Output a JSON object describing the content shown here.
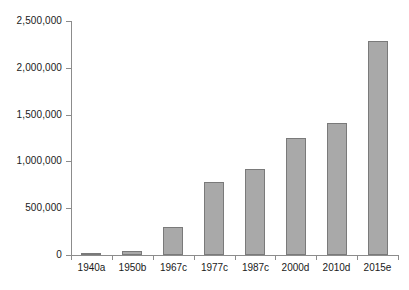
{
  "chart_data": {
    "type": "bar",
    "title": "",
    "subtitle": "",
    "xlabel": "",
    "ylabel": "",
    "categories": [
      "1940a",
      "1950b",
      "1967c",
      "1977c",
      "1987c",
      "2000d",
      "2010d",
      "2015e"
    ],
    "values": [
      20000,
      45000,
      295000,
      780000,
      920000,
      1250000,
      1410000,
      2290000
    ],
    "series": [
      {
        "name": "",
        "values": [
          20000,
          45000,
          295000,
          780000,
          920000,
          1250000,
          1410000,
          2290000
        ]
      }
    ],
    "ylim": [
      0,
      2500000
    ],
    "ytick_values": [
      0,
      500000,
      1000000,
      1500000,
      2000000,
      2500000
    ],
    "ytick_labels": [
      "0",
      "500,000",
      "1,000,000",
      "1,500,000",
      "2,000,000",
      "2,500,000"
    ],
    "grid": false,
    "legend": false,
    "legend_position": "none",
    "bar_color": "#a9a9a9",
    "bar_border_color": "#7a7a7a",
    "axis_color": "#8c8c8c",
    "text_color": "#1a1a1a",
    "background_color": "#ffffff"
  }
}
